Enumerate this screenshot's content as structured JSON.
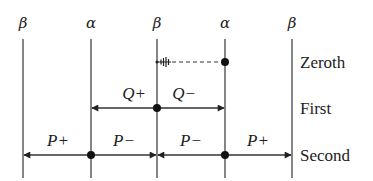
{
  "diagram": {
    "columns": [
      {
        "label": "β",
        "x": 23
      },
      {
        "label": "α",
        "x": 91
      },
      {
        "label": "β",
        "x": 157
      },
      {
        "label": "α",
        "x": 225
      },
      {
        "label": "β",
        "x": 292
      }
    ],
    "rows": [
      {
        "name": "zeroth",
        "label": "Zeroth",
        "y": 62
      },
      {
        "name": "first",
        "label": "First",
        "y": 108
      },
      {
        "name": "second",
        "label": "Second",
        "y": 155
      }
    ],
    "zeroth": {
      "from_x": 225,
      "to_x": 157,
      "style": "dashed",
      "origin_dot_x": 225,
      "end_marker": "tick-comb"
    },
    "first": {
      "origin_x": 157,
      "arrows": [
        {
          "label": "Q+",
          "from_x": 157,
          "to_x": 91
        },
        {
          "label": "Q−",
          "from_x": 157,
          "to_x": 225
        }
      ]
    },
    "second": {
      "arrows": [
        {
          "label": "P+",
          "from_x": 91,
          "to_x": 23
        },
        {
          "label": "P−",
          "from_x": 91,
          "to_x": 157
        },
        {
          "label": "P−",
          "from_x": 225,
          "to_x": 157
        },
        {
          "label": "P+",
          "from_x": 225,
          "to_x": 292
        }
      ],
      "origin_dots_x": [
        91,
        225
      ]
    },
    "colors": {
      "line": "#333333",
      "text": "#222222",
      "background": "#ffffff"
    }
  },
  "labels": {
    "col0": "β",
    "col1": "α",
    "col2": "β",
    "col3": "α",
    "col4": "β",
    "row_zeroth": "Zeroth",
    "row_first": "First",
    "row_second": "Second",
    "q_plus": "Q+",
    "q_minus": "Q−",
    "p_plus_left": "P+",
    "p_minus_left": "P−",
    "p_minus_right": "P−",
    "p_plus_right": "P+"
  }
}
